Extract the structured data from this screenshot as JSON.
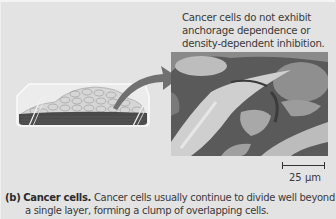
{
  "figure": {
    "top_label_lines": [
      "Cancer cells do not exhibit",
      "anchorage dependence or",
      "density-dependent inhibition."
    ],
    "scale_bar": {
      "label": "25 µm"
    },
    "caption": {
      "panel": "(b)",
      "title": "Cancer cells.",
      "line1_rest": "Cancer cells usually continue to divide well beyond",
      "line2": "a single layer, forming a clump of overlapping cells."
    },
    "illustration": {
      "dish": "culture-dish-with-piled-cancer-cells",
      "arrow": "curved-arrow-to-micrograph",
      "micrograph": "SEM-micrograph-cancer-cells"
    },
    "colors": {
      "background": "#e3e3e3",
      "arrow": "#6f6f6f",
      "cell_layer_dark": "#4a4a4a",
      "text": "#3a3a3a"
    }
  }
}
